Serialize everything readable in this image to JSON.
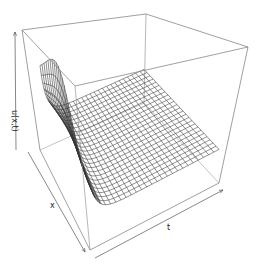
{
  "chart_data": {
    "type": "surface3d",
    "title": "",
    "xlabel": "x",
    "ylabel": "t",
    "zlabel": "u(x,t)",
    "grid_resolution": [
      25,
      25
    ],
    "box": true,
    "ticks": false
  },
  "labels": {
    "x": "x",
    "t": "t",
    "z": "u(x,t)"
  },
  "colors": {
    "mesh": "#333333",
    "box": "#888888",
    "background": "#ffffff"
  }
}
